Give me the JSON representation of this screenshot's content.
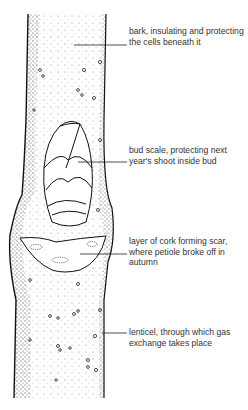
{
  "diagram": {
    "labels": [
      {
        "id": "bark",
        "text": "bark, insulating and protecting the cells beneath it",
        "line_y": 45
      },
      {
        "id": "bud-scale",
        "text": "bud scale, protecting next year's shoot inside bud",
        "line_y": 162
      },
      {
        "id": "leaf-scar",
        "text": "layer of cork forming scar, where petiole broke off in autumn",
        "line_y": 254
      },
      {
        "id": "lenticel",
        "text": "lenticel, through which gas exchange takes place",
        "line_y": 333
      }
    ]
  },
  "colors": {
    "ink": "#1a1a1a",
    "text": "#333333",
    "background": "#ffffff"
  }
}
